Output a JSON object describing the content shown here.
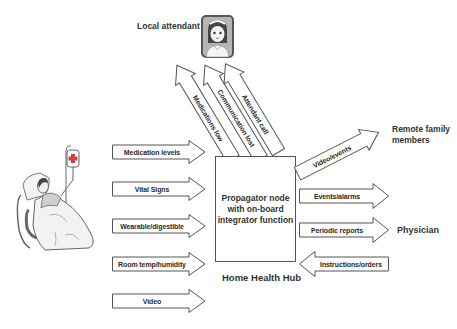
{
  "diagram": {
    "title": "Home Health Hub",
    "hub": {
      "lines": [
        "Propagator node",
        "with on-board",
        "integrator function"
      ],
      "caption": "Home Health Hub"
    },
    "actors": {
      "local_attendant": "Local attendant",
      "remote_family": [
        "Remote family",
        "members"
      ],
      "physician": "Physician",
      "patient_icon": "patient-in-bed-icon",
      "attendant_icon": "nurse-avatar-icon"
    },
    "inputs": [
      {
        "label": "Medication levels"
      },
      {
        "label": "Vital Signs"
      },
      {
        "label": "Wearable/digestible"
      },
      {
        "label": "Room temp/humidity"
      },
      {
        "label": "Video"
      }
    ],
    "to_attendant": [
      {
        "label": "Medications low"
      },
      {
        "label": "Communication lost"
      },
      {
        "label": "Attendant call"
      }
    ],
    "to_family": {
      "label": "Video/events"
    },
    "to_physician": [
      {
        "label": "Events/alarms",
        "direction": "right"
      },
      {
        "label": "Periodic reports",
        "direction": "right"
      }
    ],
    "from_physician": {
      "label": "Instructions/orders",
      "direction": "left"
    },
    "colors": {
      "stroke": "#555555",
      "text": "#333333",
      "background": "#ffffff"
    }
  }
}
